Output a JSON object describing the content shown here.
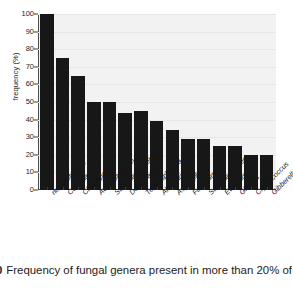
{
  "chart_data": {
    "type": "bar",
    "title": "",
    "xlabel": "",
    "ylabel": "frequency (%)",
    "ylim": [
      0,
      100
    ],
    "ytick_values": [
      0,
      10,
      20,
      30,
      40,
      50,
      60,
      70,
      80,
      90,
      100
    ],
    "grid": true,
    "legend": "none",
    "bar_color": "#171717",
    "plot_background": "#f2f2f2",
    "categories": [
      "non-culturable",
      "Candida",
      "Cladosporium",
      "Aureobasidium",
      "Saccharomycetales",
      "Dothioraceae",
      "Teratosphaeria",
      "Alternaria",
      "Aspergillus",
      "Fusarium",
      "Saccharomyces",
      "Eurotium",
      "Glomus",
      "Cryptococcus",
      "Gibberella"
    ],
    "values": [
      100,
      75,
      65,
      50,
      50,
      44,
      45,
      39,
      34,
      29,
      29,
      25,
      25,
      20,
      20
    ]
  },
  "caption": {
    "figure_number": "0",
    "text": "Frequency of fungal genera present in more than 20% of th"
  }
}
